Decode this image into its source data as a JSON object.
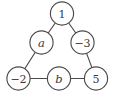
{
  "figure": {
    "type": "graph-diagram",
    "title": "",
    "background_color": "#ffffff",
    "stroke_color": "#4a4a4a",
    "label_color": "#3b3b3b",
    "node_fill": "#ffffff",
    "width": 116,
    "height": 101
  },
  "graph": {
    "node_radius": 11.6,
    "nodes": [
      {
        "id": "top",
        "label": "1",
        "italic": false,
        "cx": 62.0,
        "cy": 13.5
      },
      {
        "id": "mid-left",
        "label": "a",
        "italic": true,
        "cx": 41.5,
        "cy": 42.5
      },
      {
        "id": "mid-right",
        "label": "−3",
        "italic": false,
        "cx": 82.5,
        "cy": 42.5
      },
      {
        "id": "bottom-left",
        "label": "−2",
        "italic": false,
        "cx": 18.5,
        "cy": 78.5
      },
      {
        "id": "bottom-mid",
        "label": "b",
        "italic": true,
        "cx": 59.0,
        "cy": 78.5
      },
      {
        "id": "bottom-right",
        "label": "5",
        "italic": false,
        "cx": 96.0,
        "cy": 78.5
      }
    ],
    "edges": [
      {
        "id": "edge-top-midleft",
        "from": "top",
        "to": "mid-left"
      },
      {
        "id": "edge-top-midright",
        "from": "top",
        "to": "mid-right"
      },
      {
        "id": "edge-midleft-bottomleft",
        "from": "mid-left",
        "to": "bottom-left"
      },
      {
        "id": "edge-midright-bottomright",
        "from": "mid-right",
        "to": "bottom-right"
      },
      {
        "id": "edge-bottomleft-bottommid",
        "from": "bottom-left",
        "to": "bottom-mid"
      },
      {
        "id": "edge-bottommid-bottomright",
        "from": "bottom-mid",
        "to": "bottom-right"
      }
    ]
  }
}
